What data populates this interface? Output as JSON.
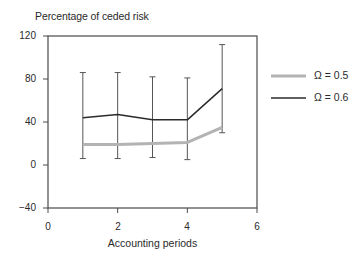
{
  "chart_data": {
    "type": "line",
    "title": "",
    "ylabel": "Percentage of ceded risk",
    "xlabel": "Accounting periods",
    "xlim": [
      0,
      6
    ],
    "ylim": [
      -40,
      120
    ],
    "x_ticks": [
      "0",
      "2",
      "4",
      "6"
    ],
    "y_ticks": [
      "120",
      "80",
      "40",
      "0",
      "−40"
    ],
    "grid": false,
    "legend_position": "right",
    "x": [
      1,
      2,
      3,
      4,
      5
    ],
    "series": [
      {
        "name": "Ω = 0.5",
        "color": "#b3b3b3",
        "values": [
          19,
          19,
          20,
          21,
          35
        ]
      },
      {
        "name": "Ω = 0.6",
        "color": "#2b2b2b",
        "values": [
          44,
          47,
          42,
          42,
          71
        ]
      }
    ],
    "error_bars": {
      "upper": [
        86,
        86,
        82,
        81,
        112
      ],
      "lower": [
        6,
        6,
        7,
        5,
        30
      ]
    }
  },
  "labels": {
    "ylabel": "Percentage of ceded risk",
    "xlabel": "Accounting periods",
    "y_ticks": [
      "120",
      "80",
      "40",
      "0",
      "−40"
    ],
    "x_ticks": [
      "0",
      "2",
      "4",
      "6"
    ],
    "legend": [
      "Ω = 0.5",
      "Ω = 0.6"
    ]
  }
}
